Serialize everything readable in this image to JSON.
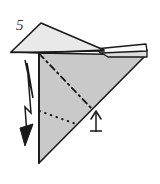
{
  "diagram": {
    "type": "origami-folding-step",
    "step_number": "5",
    "colors": {
      "paper_front": "#c9c9c9",
      "paper_back": "#e9e9e9",
      "paper_white": "#fbfbfb",
      "outline": "#1a1a1a",
      "crease_line": "#1a1a1a",
      "arrow": "#1a1a1a",
      "background": "#ffffff",
      "label": "#3a3a3a"
    },
    "shapes": {
      "main_triangle": {
        "name": "main-body-triangle",
        "points": "39,53 146,55 39,163",
        "fill": "#c9c9c9"
      },
      "upper_left_flap": {
        "name": "upper-left-flap",
        "points": "11,52 41,23 103,50 39,53",
        "fill": "#e9e9e9"
      },
      "right_sliver_upper": {
        "name": "right-sliver-upper-flap",
        "points": "98,48 146,45 146,52 103,52",
        "fill": "#fbfbfb"
      },
      "right_sliver_lower": {
        "name": "right-sliver-lower-flap",
        "points": "103,52 146,50 146,56 106,56",
        "fill": "#e0e0e0"
      }
    },
    "creases": [
      {
        "name": "valley-fold-diagonal",
        "style": "dash-dot",
        "from": "39,53",
        "to": "93,110"
      },
      {
        "name": "hidden-fold-horizontal",
        "style": "dotted",
        "from": "39,111",
        "to": "79,125"
      }
    ],
    "arrows": [
      {
        "name": "fold-down-zigzag-arrow",
        "direction": "down",
        "label": ""
      },
      {
        "name": "push-up-arrow",
        "direction": "up",
        "label": ""
      }
    ]
  }
}
